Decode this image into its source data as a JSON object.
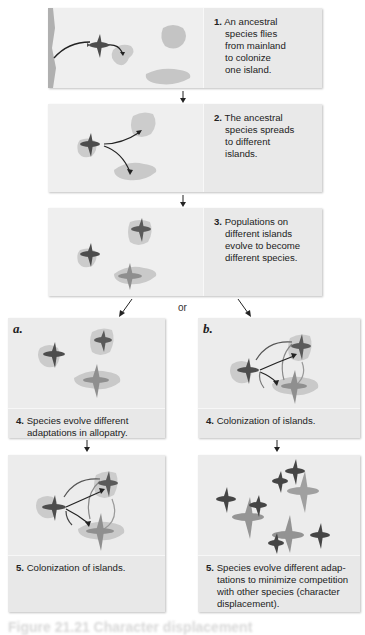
{
  "diagram": {
    "colors": {
      "panel_bg": "#ececec",
      "text_bg": "#e9e9e9",
      "ancestral_bird": "#4d4d4d",
      "derived_bird_light": "#8a8a8a",
      "island": "#c8c8c8",
      "mainland": "#b0b0b0",
      "arrow": "#222222"
    },
    "steps": [
      {
        "num": "1.",
        "lines": [
          "An ancestral",
          "species flies",
          "from mainland",
          "to colonize",
          "one island."
        ]
      },
      {
        "num": "2.",
        "lines": [
          "The ancestral",
          "species spreads",
          "to different",
          "islands."
        ]
      },
      {
        "num": "3.",
        "lines": [
          "Populations on",
          "different islands",
          "evolve to become",
          "different species."
        ]
      }
    ],
    "branch_connector": "or",
    "branches": [
      {
        "label": "a.",
        "step4": {
          "num": "4.",
          "lines": [
            "Species evolve different",
            "adaptations in allopatry."
          ]
        },
        "step5": {
          "num": "5.",
          "lines": [
            "Colonization of islands."
          ]
        }
      },
      {
        "label": "b.",
        "step4": {
          "num": "4.",
          "lines": [
            "Colonization of islands."
          ]
        },
        "step5": {
          "num": "5.",
          "lines": [
            "Species evolve different adap-",
            "tations to minimize competition",
            "with other species (character",
            "displacement)."
          ]
        }
      }
    ],
    "figure_caption_partial": "Figure 21.21  Character displacement"
  }
}
